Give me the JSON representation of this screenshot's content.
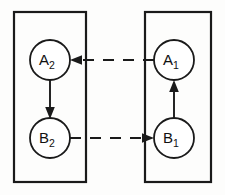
{
  "figure": {
    "type": "commutative-diagram",
    "background_color": "#fdfdfc",
    "stroke_color": "#1a1a1a",
    "node_fill_color": "#ffffff"
  },
  "groups": [
    {
      "id": "left-box",
      "label": "",
      "x": 14,
      "y": 12,
      "width": 72,
      "height": 170
    },
    {
      "id": "right-box",
      "label": "",
      "x": 145,
      "y": 12,
      "width": 66,
      "height": 170
    }
  ],
  "nodes": [
    {
      "id": "A2",
      "base": "A",
      "subscript": "2",
      "cx": 50,
      "cy": 60,
      "r": 20,
      "group": "left-box"
    },
    {
      "id": "B2",
      "base": "B",
      "subscript": "2",
      "cx": 50,
      "cy": 138,
      "r": 20,
      "group": "left-box"
    },
    {
      "id": "A1",
      "base": "A",
      "subscript": "1",
      "cx": 174,
      "cy": 60,
      "r": 20,
      "group": "right-box"
    },
    {
      "id": "B1",
      "base": "B",
      "subscript": "1",
      "cx": 174,
      "cy": 138,
      "r": 20,
      "group": "right-box"
    }
  ],
  "edges": [
    {
      "id": "edge-A2-to-B2",
      "from": "A2",
      "to": "B2",
      "style": "solid",
      "direction": "down",
      "label": ""
    },
    {
      "id": "edge-B1-to-A1",
      "from": "B1",
      "to": "A1",
      "style": "solid",
      "direction": "up",
      "label": ""
    },
    {
      "id": "edge-A1-to-A2",
      "from": "A1",
      "to": "A2",
      "style": "dashed",
      "direction": "left",
      "label": ""
    },
    {
      "id": "edge-B2-to-B1",
      "from": "B2",
      "to": "B1",
      "style": "dashed",
      "direction": "right",
      "label": ""
    }
  ]
}
